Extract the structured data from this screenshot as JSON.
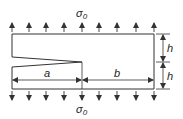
{
  "diagram": {
    "type": "cracked-plate-under-tension",
    "colors": {
      "line": "#333333",
      "background": "#ffffff"
    },
    "labels": {
      "stress_top": "σ",
      "stress_top_sub": "0",
      "stress_bottom": "σ",
      "stress_bottom_sub": "0",
      "crack_length": "a",
      "ligament_length": "b",
      "half_height_upper": "h",
      "half_height_lower": "h"
    },
    "plate": {
      "x": 12,
      "y": 34,
      "width": 142,
      "height": 55
    },
    "crack": {
      "tip_x": 82,
      "mid_y": 62,
      "mouth_top_y": 57,
      "mouth_bottom_y": 67
    },
    "arrows_x": [
      12,
      29,
      46,
      64,
      82,
      99,
      117,
      136,
      154
    ]
  }
}
